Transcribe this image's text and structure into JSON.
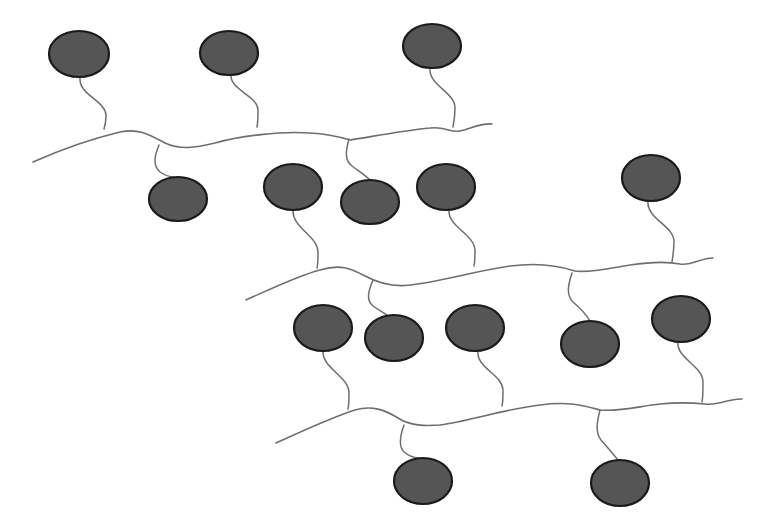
{
  "diagram": {
    "colors": {
      "background": "#ffffff",
      "chain": "#6e6e6e",
      "bead_fill": "#555555",
      "bead_stroke": "#1a1a1a"
    },
    "chains": [
      {
        "id": "chain-1",
        "path": "M33,162 C60,150 95,138 120,132 C140,128 150,135 165,143 C180,150 195,148 215,143 C240,136 280,131 310,133 C330,134 340,137 350,140 C370,137 400,131 430,128 C445,126 450,133 460,131 C470,129 480,123 492,124",
        "pendants": [
          {
            "cx": 79,
            "cy": 54,
            "rx": 30,
            "ry": 23,
            "tether": "M80,77 C78,95 105,100 106,115 C106,122 105,126 104,129"
          },
          {
            "cx": 229,
            "cy": 53,
            "rx": 29,
            "ry": 22,
            "tether": "M231,75 C230,90 258,96 258,110 C258,118 258,122 257,127"
          },
          {
            "cx": 432,
            "cy": 46,
            "rx": 29,
            "ry": 22,
            "tether": "M430,68 C428,85 455,92 455,108 C455,116 454,122 453,127"
          },
          {
            "cx": 178,
            "cy": 199,
            "rx": 29,
            "ry": 22,
            "tether": "M159,145 C155,155 152,165 160,172 C166,176 172,177 174,177"
          },
          {
            "cx": 370,
            "cy": 202,
            "rx": 29,
            "ry": 22,
            "tether": "M349,139 C346,150 344,160 352,166 C360,172 366,176 370,180"
          }
        ]
      },
      {
        "id": "chain-2",
        "path": "M246,300 C275,287 300,275 320,270 C340,264 350,268 365,276 C380,284 395,287 410,285 C440,282 470,272 510,266 C540,262 560,266 575,271 C590,273 610,268 630,265 C650,262 665,261 680,264 C692,266 700,258 713,258",
        "pendants": [
          {
            "cx": 293,
            "cy": 187,
            "rx": 29,
            "ry": 23,
            "tether": "M293,210 C292,228 318,236 318,252 C318,260 318,265 317,268"
          },
          {
            "cx": 446,
            "cy": 187,
            "rx": 29,
            "ry": 23,
            "tether": "M449,210 C447,226 474,234 475,250 C475,256 475,261 474,266"
          },
          {
            "cx": 651,
            "cy": 178,
            "rx": 29,
            "ry": 23,
            "tether": "M648,201 C646,218 673,226 674,240 C674,250 673,256 672,262"
          },
          {
            "cx": 323,
            "cy": 328,
            "rx": 29,
            "ry": 23,
            "tether": "M373,280 C368,292 366,300 373,306 C380,311 385,313 388,316"
          },
          {
            "cx": 394,
            "cy": 338,
            "rx": 29,
            "ry": 23,
            "tether": "M373,280 C368,292 366,300 373,306 C380,311 385,313 388,316"
          },
          {
            "cx": 475,
            "cy": 328,
            "rx": 29,
            "ry": 23,
            "tether": ""
          },
          {
            "cx": 590,
            "cy": 344,
            "rx": 29,
            "ry": 23,
            "tether": "M572,273 C568,285 566,295 573,302 C580,308 586,314 590,321"
          },
          {
            "cx": 681,
            "cy": 319,
            "rx": 29,
            "ry": 23,
            "tether": ""
          }
        ]
      },
      {
        "id": "chain-3",
        "path": "M276,443 C305,430 330,418 355,410 C372,405 385,410 398,418 C410,426 425,426 440,425 C470,421 500,410 540,405 C570,401 585,406 600,410 C620,412 640,406 660,404 C680,402 695,403 705,404 C718,406 730,398 742,399",
        "pendants": [
          {
            "cx": 323,
            "cy": 328,
            "rx": 29,
            "ry": 23,
            "tether": "M323,351 C322,368 348,376 349,392 C349,400 349,405 348,409"
          },
          {
            "cx": 475,
            "cy": 328,
            "rx": 29,
            "ry": 23,
            "tether": "M478,351 C476,368 502,374 503,390 C503,397 503,402 502,406"
          },
          {
            "cx": 681,
            "cy": 319,
            "rx": 29,
            "ry": 23,
            "tether": "M678,342 C676,358 703,366 703,382 C703,392 703,398 702,402"
          },
          {
            "cx": 423,
            "cy": 481,
            "rx": 29,
            "ry": 23,
            "tether": "M404,425 C400,436 398,446 404,452 C410,457 416,458 420,458"
          },
          {
            "cx": 620,
            "cy": 483,
            "rx": 29,
            "ry": 23,
            "tether": "M600,410 C597,422 595,432 601,440 C608,448 614,455 618,460"
          }
        ]
      }
    ]
  }
}
